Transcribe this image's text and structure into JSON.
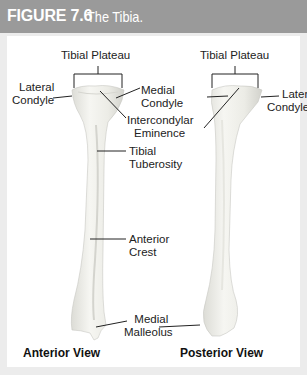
{
  "figure": {
    "number": "FIGURE 7.6",
    "title": "The Tibia."
  },
  "anterior": {
    "view_label": "Anterior View",
    "labels": {
      "tibial_plateau": "Tibial Plateau",
      "lateral_condyle_1": "Lateral",
      "lateral_condyle_2": "Condyle",
      "medial_condyle_1": "Medial",
      "medial_condyle_2": "Condyle",
      "intercondylar_1": "Intercondylar",
      "intercondylar_2": "Eminence",
      "tibial_tuberosity_1": "Tibial",
      "tibial_tuberosity_2": "Tuberosity",
      "anterior_crest_1": "Anterior",
      "anterior_crest_2": "Crest",
      "medial_malleolus_1": "Medial",
      "medial_malleolus_2": "Malleolus"
    }
  },
  "posterior": {
    "view_label": "Posterior View",
    "labels": {
      "tibial_plateau": "Tibial Plateau",
      "lateral_condyle_1": "Lateral",
      "lateral_condyle_2": "Condyle"
    }
  },
  "colors": {
    "header_bg": "#9a9a9a",
    "frame_bg": "#ececec",
    "panel_bg": "#ffffff",
    "bone_fill": "#efefe9",
    "bone_shade": "#d8d8d2",
    "leader_line": "#222222"
  }
}
